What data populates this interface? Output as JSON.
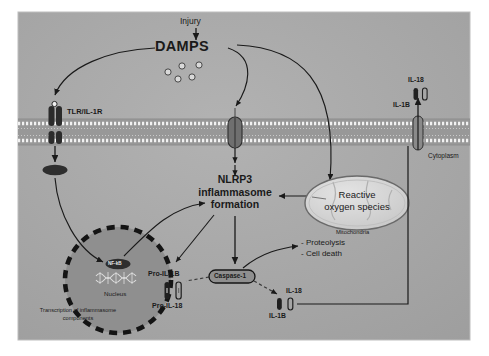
{
  "figure": {
    "panel_bg": "#a8a8a8",
    "outer_bg": "#ffffff",
    "ink": "#1a1a1a"
  },
  "stimulus": {
    "injury_label": "Injury",
    "damps_label": "DAMPS",
    "damp_particle_count": 5
  },
  "membrane": {
    "receptor_tlr_label": "TLR/IL-1R",
    "cytoplasm_label": "Cytoplasm",
    "channel_name": "membrane-channel"
  },
  "secreted_top": {
    "il18_label": "IL-18",
    "il1b_label": "IL-1B"
  },
  "nucleus": {
    "nucleus_label": "Nucleus",
    "nfkb_label": "NF-kB",
    "transcription_label": "Transcription of inflammasome components",
    "transcription_line1": "Transcription of inflammasome",
    "transcription_line2": "components"
  },
  "inflammasome": {
    "line1": "NLRP3",
    "line2": "inflammasome",
    "line3": "formation",
    "caspase_label": "Caspase-1"
  },
  "mitochondria": {
    "ros_line1": "Reactive",
    "ros_line2": "oxygen species",
    "organelle_label": "Mitochondria"
  },
  "precursors": {
    "pro_il1b_label": "Pro-IL-1B",
    "pro_il18_label": "Pro-IL-18"
  },
  "outcomes": {
    "item1": "- Proteolysis",
    "item2": "- Cell death"
  },
  "secreted_bottom": {
    "il18_label": "IL-18",
    "il1b_label": "IL-1B"
  }
}
